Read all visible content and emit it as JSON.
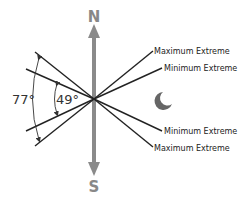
{
  "diagram": {
    "compass": {
      "north_label": "N",
      "south_label": "S",
      "color": "#8a8a8a"
    },
    "angles": {
      "outer": "77°",
      "inner": "49°"
    },
    "lines": [
      {
        "label": "Maximum Extreme",
        "side": "upper"
      },
      {
        "label": "Minimum Extreme",
        "side": "upper"
      },
      {
        "label": "Minimum Extreme",
        "side": "lower"
      },
      {
        "label": "Maximum Extreme",
        "side": "lower"
      }
    ],
    "icons": {
      "moon": "moon-icon"
    },
    "line_color": "#222222"
  }
}
